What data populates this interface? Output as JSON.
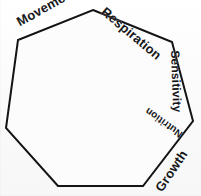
{
  "diagram": {
    "type": "heptagon",
    "shape": {
      "fill_color": "#fcfcfc",
      "stroke_color": "#141414",
      "stroke_width": 2,
      "sides": 7,
      "points": "93,10 172,42 193,121 143,186 58,186 6,128 18,40"
    },
    "background_color": "#fdfdfd",
    "labels": [
      {
        "id": "movement",
        "text": "Movement",
        "edge": "upper-left",
        "rotation": -29
      },
      {
        "id": "respiration",
        "text": "Respiration",
        "edge": "upper-right",
        "rotation": 40
      },
      {
        "id": "sensitivity",
        "text": "Sensitivity",
        "edge": "right",
        "rotation": 88
      },
      {
        "id": "nutrition",
        "text": "Nutrition",
        "edge": "lower-right-inner",
        "rotation": 216
      },
      {
        "id": "growth",
        "text": "Growth",
        "edge": "lower-right",
        "rotation": -56
      }
    ]
  }
}
